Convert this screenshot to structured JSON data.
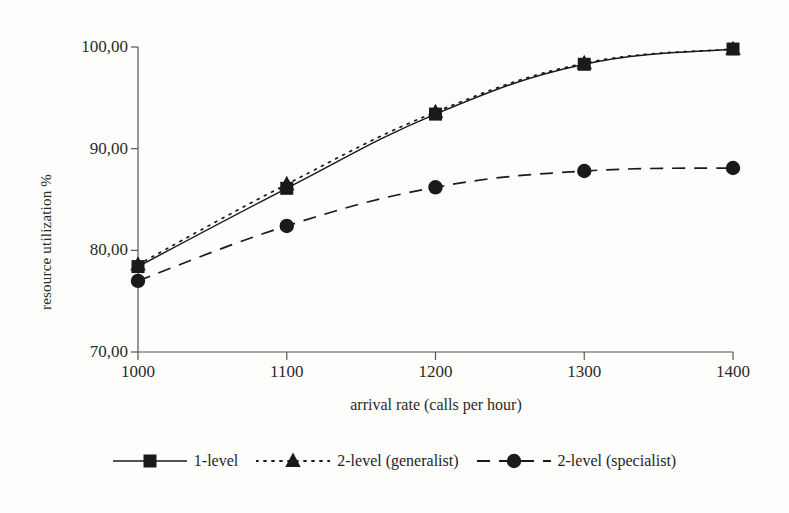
{
  "chart_data": {
    "type": "line",
    "title": "",
    "xlabel": "arrival rate (calls per hour)",
    "ylabel": "resource utilization %",
    "x": [
      1000,
      1100,
      1200,
      1300,
      1400
    ],
    "xtick_labels": [
      "1000",
      "1100",
      "1200",
      "1300",
      "1400"
    ],
    "ytick_labels": [
      "70,00",
      "80,00",
      "90,00",
      "100,00"
    ],
    "yticks": [
      70,
      80,
      90,
      100
    ],
    "xlim": [
      1000,
      1400
    ],
    "ylim": [
      70,
      100
    ],
    "grid": false,
    "legend_position": "bottom",
    "series": [
      {
        "name": "1-level",
        "marker": "square",
        "line_style": "solid",
        "color": "#1a1a1a",
        "values": [
          78.4,
          86.1,
          93.4,
          98.3,
          99.8
        ]
      },
      {
        "name": "2-level (generalist)",
        "marker": "triangle",
        "line_style": "dotted",
        "color": "#1a1a1a",
        "values": [
          78.6,
          86.5,
          93.6,
          98.4,
          99.8
        ]
      },
      {
        "name": "2-level (specialist)",
        "marker": "circle",
        "line_style": "dashed",
        "color": "#1a1a1a",
        "values": [
          77.0,
          82.4,
          86.2,
          87.8,
          88.1
        ]
      }
    ]
  },
  "legend": {
    "items": [
      {
        "label": "1-level",
        "key": "solid-square-key"
      },
      {
        "label": "2-level (generalist)",
        "key": "dotted-triangle-key"
      },
      {
        "label": "2-level (specialist)",
        "key": "dashed-circle-key"
      }
    ]
  }
}
